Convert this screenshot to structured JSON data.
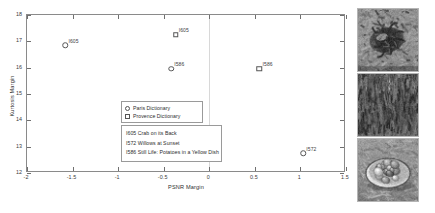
{
  "chart_data": {
    "type": "scatter",
    "title": "",
    "xlabel": "PSNR Margin",
    "ylabel": "Kurtosis Margin",
    "xlim": [
      -2,
      1.5
    ],
    "ylim": [
      12,
      18
    ],
    "xticks": [
      "-2",
      "-1.5",
      "-1",
      "-0.5",
      "0",
      "0.5",
      "1",
      "1.5"
    ],
    "xtick_values": [
      -2,
      -1.5,
      -1,
      -0.5,
      0,
      0.5,
      1,
      1.5
    ],
    "yticks": [
      "12",
      "13",
      "14",
      "15",
      "16",
      "17",
      "18"
    ],
    "ytick_values": [
      12,
      13,
      14,
      15,
      16,
      17,
      18
    ],
    "grid": "vertical-at-zero",
    "legend_position": "center",
    "series": [
      {
        "name": "Paris Dictionary",
        "marker": "circle",
        "points": [
          {
            "label": "I605",
            "x": -1.58,
            "y": 16.85
          },
          {
            "label": "I586",
            "x": -0.42,
            "y": 15.95
          },
          {
            "label": "I572",
            "x": 1.03,
            "y": 12.75
          }
        ]
      },
      {
        "name": "Provence Dictionary",
        "marker": "square",
        "points": [
          {
            "label": "I605",
            "x": -0.37,
            "y": 17.25
          },
          {
            "label": "I586",
            "x": 0.55,
            "y": 15.95
          }
        ]
      }
    ],
    "annotations": [
      "I605 Crab on its Back",
      "I572 Willows at Sunset",
      "I586 Still Life: Potatoes in a Yellow Dish"
    ]
  },
  "legend": {
    "entries": [
      {
        "label": "Paris Dictionary",
        "marker": "circle"
      },
      {
        "label": "Provence Dictionary",
        "marker": "square"
      }
    ]
  },
  "thumbnails": [
    {
      "name": "crab-on-its-back-thumbnail",
      "caption": "I605 Crab on its Back"
    },
    {
      "name": "willows-at-sunset-thumbnail",
      "caption": "I572 Willows at Sunset"
    },
    {
      "name": "potatoes-in-a-yellow-dish-thumbnail",
      "caption": "I586 Still Life: Potatoes in a Yellow Dish"
    }
  ],
  "colors": {
    "axis": "#8a8a8a",
    "grid": "#d8d8d8",
    "marker_stroke": "#555555",
    "text": "#2e2e2e",
    "background": "#ffffff"
  }
}
